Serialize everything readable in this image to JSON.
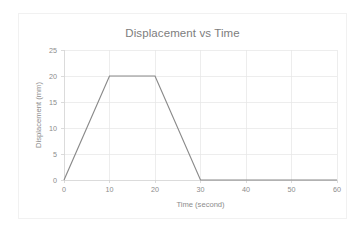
{
  "figure": {
    "background_color": "#ffffff",
    "border_color": "#f1f1f1"
  },
  "chart_data": {
    "type": "line",
    "title": "Displacement vs Time",
    "xlabel": "Time (second)",
    "ylabel": "Displacement (mm)",
    "xlim": [
      0,
      60
    ],
    "ylim": [
      0,
      25
    ],
    "grid": true,
    "legend": false,
    "legend_position": "none",
    "line_color": "#8a8a8a",
    "grid_color": "#e6e6e6",
    "axis_color": "#d2d2d2",
    "text_color": "#8c8c8c",
    "xticks": [
      0,
      10,
      20,
      30,
      40,
      50,
      60
    ],
    "xtick_labels": [
      "0",
      "10",
      "20",
      "30",
      "40",
      "50",
      "60"
    ],
    "yticks": [
      0,
      5,
      10,
      15,
      20,
      25
    ],
    "ytick_labels": [
      "0",
      "5",
      "10",
      "15",
      "20",
      "25"
    ],
    "series": [
      {
        "name": "Displacement",
        "x": [
          0,
          10,
          20,
          30,
          60
        ],
        "y": [
          0,
          20,
          20,
          0,
          0
        ]
      }
    ]
  }
}
